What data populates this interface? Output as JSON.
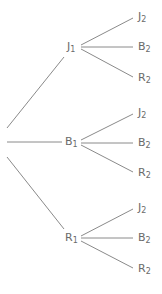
{
  "tree": {
    "line_color": "#8a8a8a",
    "label_color": "#6a6a6a",
    "first_level": [
      {
        "letter": "J",
        "sub": "1",
        "children": [
          {
            "letter": "J",
            "sub": "2"
          },
          {
            "letter": "B",
            "sub": "2"
          },
          {
            "letter": "R",
            "sub": "2"
          }
        ]
      },
      {
        "letter": "B",
        "sub": "1",
        "children": [
          {
            "letter": "J",
            "sub": "2"
          },
          {
            "letter": "B",
            "sub": "2"
          },
          {
            "letter": "R",
            "sub": "2"
          }
        ]
      },
      {
        "letter": "R",
        "sub": "1",
        "children": [
          {
            "letter": "J",
            "sub": "2"
          },
          {
            "letter": "B",
            "sub": "2"
          },
          {
            "letter": "R",
            "sub": "2"
          }
        ]
      }
    ]
  }
}
